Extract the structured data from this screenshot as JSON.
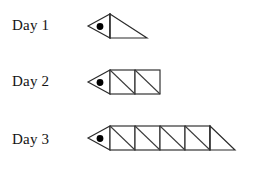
{
  "page": {
    "background_color": "#ffffff",
    "line_color": "#2b2b2b",
    "dot_color": "#000000",
    "width": 256,
    "height": 169
  },
  "rows": [
    {
      "label": "Day 1",
      "day_number": 1,
      "squares": 0,
      "end_triangle": true,
      "head": true,
      "triangle_count": 1
    },
    {
      "label": "Day 2",
      "day_number": 2,
      "squares": 2,
      "end_triangle": false,
      "head": true,
      "triangle_count": 4
    },
    {
      "label": "Day 3",
      "day_number": 3,
      "squares": 4,
      "end_triangle": true,
      "head": true,
      "triangle_count": 9
    }
  ],
  "geometry": {
    "head_tip_x": 88,
    "head_base_x": 110,
    "body_top_y": 14,
    "body_bottom_y": 38,
    "square_size": 25,
    "end_triangle_width": 37,
    "end_triangle_width_day3": 24,
    "dot_cx": 100,
    "dot_cy": 26,
    "dot_r": 3.4
  }
}
